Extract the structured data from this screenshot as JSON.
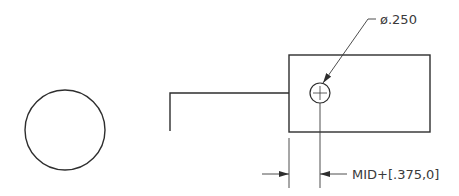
{
  "drawing": {
    "hole_callout": "ø.250",
    "offset_dimension": "MID+[.375,0]",
    "colors": {
      "line": "#2e2e2e",
      "text": "#3a3a3a",
      "background": "#ffffff"
    }
  }
}
